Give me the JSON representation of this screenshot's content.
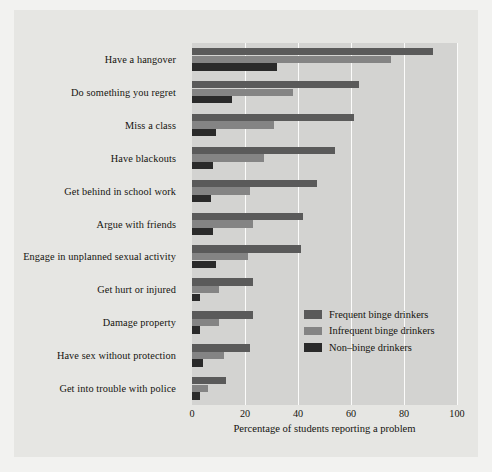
{
  "chart_data": {
    "type": "bar",
    "orientation": "horizontal",
    "title": "",
    "xlabel": "Percentage of students reporting a problem",
    "ylabel": "",
    "xlim": [
      0,
      100
    ],
    "xticks": [
      0,
      20,
      40,
      60,
      80,
      100
    ],
    "xtick_labels": [
      "0",
      "20",
      "40",
      "60",
      "80",
      "100"
    ],
    "grid": "vertical-white-gridlines",
    "legend_position": "lower-right-inside",
    "categories": [
      "Have a hangover",
      "Do something you regret",
      "Miss a class",
      "Have blackouts",
      "Get behind in school work",
      "Argue with friends",
      "Engage in unplanned sexual activity",
      "Get hurt or injured",
      "Damage property",
      "Have sex without protection",
      "Get into trouble with police"
    ],
    "series": [
      {
        "name": "Frequent binge drinkers",
        "color": "#5a5a5a",
        "values": [
          91,
          63,
          61,
          54,
          47,
          42,
          41,
          23,
          23,
          22,
          13
        ]
      },
      {
        "name": "Infrequent binge drinkers",
        "color": "#848484",
        "values": [
          75,
          38,
          31,
          27,
          22,
          23,
          21,
          10,
          10,
          12,
          6
        ]
      },
      {
        "name": "Non–binge drinkers",
        "color": "#2a2a2a",
        "values": [
          32,
          15,
          9,
          8,
          7,
          8,
          9,
          3,
          3,
          4,
          3
        ]
      }
    ],
    "colors": {
      "page_background": "#e6e6e3",
      "panel_background": "#d3d3d1",
      "gridline": "#fbfbfa",
      "text": "#15140f"
    }
  }
}
